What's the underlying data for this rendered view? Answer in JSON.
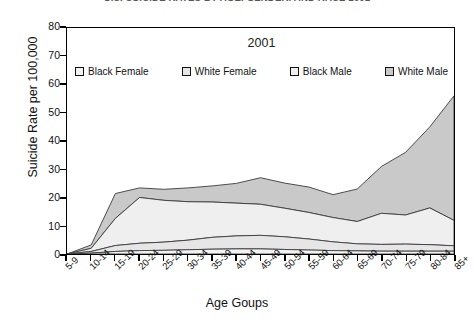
{
  "supertitle": "U.S. SUICIDE RATES BY AGE, GENDER, AND RACE 2001",
  "chart_title": "2001",
  "axis": {
    "ylabel": "Suicide Rate per 100,000",
    "xlabel": "Age Goups",
    "yticks": [
      0,
      10,
      20,
      30,
      40,
      50,
      60,
      70,
      80
    ]
  },
  "legend": [
    {
      "label": "Black Female",
      "color": "#f2f2f2"
    },
    {
      "label": "White Female",
      "color": "#e6e6e6"
    },
    {
      "label": "Black Male",
      "color": "#efefef"
    },
    {
      "label": "White Male",
      "color": "#c9c9c9"
    }
  ],
  "chart_data": {
    "type": "area",
    "stacked": true,
    "title": "2001",
    "xlabel": "Age Goups",
    "ylabel": "Suicide Rate per 100,000",
    "ylim": [
      0,
      80
    ],
    "grid": false,
    "legend_position": "top-inside",
    "categories": [
      "5-9",
      "10-14",
      "15-19",
      "20-24",
      "25-29",
      "30-34",
      "35-39",
      "40-44",
      "45-49",
      "50-54",
      "55-59",
      "60-64",
      "65-69",
      "70-74",
      "75-79",
      "80-84",
      "85+"
    ],
    "series": [
      {
        "name": "Black Female",
        "color": "#f2f2f2",
        "values": [
          0.0,
          0.3,
          0.9,
          1.2,
          1.3,
          1.5,
          1.7,
          1.8,
          1.8,
          1.6,
          1.4,
          1.2,
          1.1,
          1.0,
          1.0,
          1.0,
          1.0
        ]
      },
      {
        "name": "White Female",
        "color": "#e6e6e6",
        "values": [
          0.0,
          0.6,
          2.1,
          2.6,
          2.9,
          3.4,
          4.2,
          4.6,
          4.8,
          4.5,
          3.9,
          3.1,
          2.5,
          2.4,
          2.5,
          2.3,
          1.9
        ]
      },
      {
        "name": "Black Male",
        "color": "#efefef",
        "values": [
          0.0,
          1.1,
          9.6,
          16.2,
          14.8,
          13.6,
          12.5,
          11.6,
          11.0,
          10.1,
          9.4,
          8.6,
          7.9,
          11.0,
          10.3,
          13.0,
          9.0
        ]
      },
      {
        "name": "White Male",
        "color": "#c9c9c9",
        "values": [
          0.0,
          1.2,
          8.8,
          3.4,
          3.9,
          4.9,
          5.7,
          7.0,
          9.4,
          8.9,
          9.0,
          8.1,
          11.5,
          16.6,
          22.2,
          28.7,
          44.1
        ]
      }
    ],
    "totals": [
      0.0,
      3.2,
      21.4,
      23.4,
      22.9,
      23.4,
      24.1,
      25.0,
      27.0,
      25.1,
      23.7,
      21.0,
      23.0,
      31.0,
      36.0,
      45.0,
      56.0
    ]
  }
}
